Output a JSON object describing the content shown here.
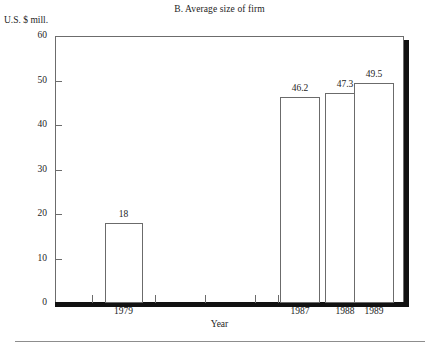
{
  "chart_data": {
    "type": "bar",
    "title": "B. Average size of firm",
    "xlabel": "Year",
    "ylabel": "U.S. $ mill.",
    "categories": [
      "1979",
      "1987",
      "1988",
      "1989"
    ],
    "values": [
      18,
      46.2,
      47.3,
      49.5
    ],
    "value_labels": [
      "18",
      "46.2",
      "47.3",
      "49.5"
    ],
    "ylim": [
      0,
      60
    ],
    "yticks": [
      0,
      10,
      20,
      30,
      40,
      50,
      60
    ],
    "ytick_labels": [
      "0",
      "10",
      "20",
      "30",
      "40",
      "50",
      "60"
    ],
    "grid": false,
    "legend": null,
    "bar_fill": "#ffffff",
    "bar_edge": "#6b6b6b",
    "frame_color": "#6c6c6c",
    "shadow_color": "#111111"
  },
  "axes": {
    "y_title": "U.S. $ mill.",
    "x_title": "Year"
  }
}
